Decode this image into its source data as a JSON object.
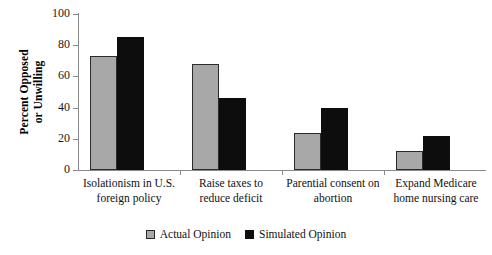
{
  "chart_data": {
    "type": "bar",
    "title": "",
    "xlabel": "",
    "ylabel_line1": "Percent Opposed",
    "ylabel_line2": "or Unwilling",
    "ylim": [
      0,
      100
    ],
    "yticks": [
      0,
      20,
      40,
      60,
      80,
      100
    ],
    "ytick_labels": [
      "0",
      "20",
      "40",
      "60",
      "80",
      "100"
    ],
    "grid": false,
    "legend_position": "bottom-center",
    "categories": [
      {
        "line1": "Isolationism in U.S.",
        "line2": "foreign policy"
      },
      {
        "line1": "Raise taxes to",
        "line2": "reduce deficit"
      },
      {
        "line1": "Parential consent on",
        "line2": "abortion"
      },
      {
        "line1": "Expand Medicare",
        "line2": "home nursing care"
      }
    ],
    "series": [
      {
        "name": "Actual Opinion",
        "color": "#a8a8a8",
        "values": [
          73,
          68,
          24,
          12
        ]
      },
      {
        "name": "Simulated Opinion",
        "color": "#0d0d0d",
        "values": [
          85,
          46,
          40,
          22
        ]
      }
    ]
  },
  "legend": {
    "items": [
      {
        "label": "Actual Opinion"
      },
      {
        "label": "Simulated Opinion"
      }
    ]
  }
}
